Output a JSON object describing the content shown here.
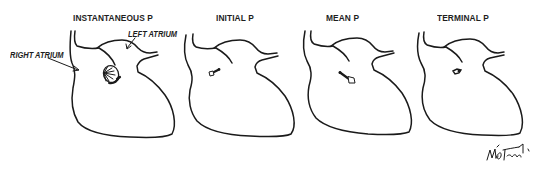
{
  "figure": {
    "panels": [
      {
        "title": "INSTANTANEOUS P",
        "vector": "instantaneous-p-loop"
      },
      {
        "title": "INITIAL P",
        "vector": "initial-p-vector"
      },
      {
        "title": "MEAN P",
        "vector": "mean-p-vector"
      },
      {
        "title": "TERMINAL P",
        "vector": "terminal-p-vector"
      }
    ],
    "labels": {
      "right_atrium": "RIGHT ATRIUM",
      "left_atrium": "LEFT ATRIUM"
    },
    "colors": {
      "line": "#1a1a1a",
      "background": "#ffffff"
    }
  }
}
